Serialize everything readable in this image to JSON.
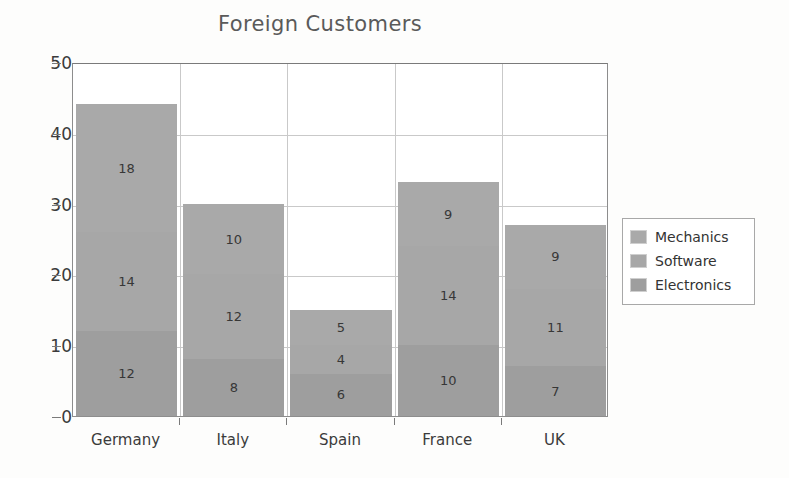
{
  "chart_data": {
    "type": "bar",
    "subtype": "stacked-vertical",
    "title": "Foreign Customers",
    "xlabel": "",
    "ylabel": "",
    "ylim": [
      0,
      50
    ],
    "y_ticks": [
      0,
      10,
      20,
      30,
      40,
      50
    ],
    "grid": true,
    "legend_position": "right",
    "categories": [
      "Germany",
      "Italy",
      "Spain",
      "France",
      "UK"
    ],
    "series": [
      {
        "name": "Electronics",
        "values": [
          12,
          8,
          6,
          10,
          7
        ],
        "color": "#9e9e9e"
      },
      {
        "name": "Software",
        "values": [
          14,
          12,
          4,
          14,
          11
        ],
        "color": "#a7a7a7"
      },
      {
        "name": "Mechanics",
        "values": [
          18,
          10,
          5,
          9,
          9
        ],
        "color": "#a9a9a9"
      }
    ],
    "totals": [
      44,
      30,
      15,
      33,
      27
    ],
    "legend_order": [
      "Mechanics",
      "Software",
      "Electronics"
    ]
  },
  "legend": {
    "items": [
      {
        "label": "Mechanics",
        "color": "#a9a9a9"
      },
      {
        "label": "Software",
        "color": "#a7a7a7"
      },
      {
        "label": "Electronics",
        "color": "#9e9e9e"
      }
    ]
  },
  "colors": {
    "plot_border": "#8d8d8d",
    "gridline": "#c9c9c9",
    "title_text": "#5a5a5a",
    "axis_text": "#3b3b3b",
    "background": "#fdfdfc"
  }
}
